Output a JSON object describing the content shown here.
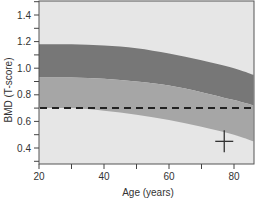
{
  "chart_data": {
    "type": "area",
    "title": "",
    "xlabel": "Age (years)",
    "ylabel": "BMD (T-score)",
    "xlim": [
      20,
      86
    ],
    "ylim": [
      0.3,
      1.5
    ],
    "xticks": [
      20,
      40,
      60,
      80
    ],
    "xtick_labels": [
      "20",
      "40",
      "60",
      "80"
    ],
    "yticks": [
      0.4,
      0.6,
      0.8,
      1.0,
      1.2,
      1.4
    ],
    "ytick_labels": [
      "0.4",
      "0.6",
      "0.8",
      "1.0",
      "1.2",
      "1.4"
    ],
    "grid": false,
    "legend": null,
    "x": [
      20,
      30,
      40,
      50,
      60,
      70,
      80,
      86
    ],
    "series": [
      {
        "name": "upper band (dark)",
        "color": "#777777",
        "upper": [
          1.18,
          1.18,
          1.17,
          1.15,
          1.11,
          1.06,
          1.0,
          0.95
        ],
        "lower": [
          0.93,
          0.93,
          0.92,
          0.9,
          0.87,
          0.82,
          0.76,
          0.72
        ]
      },
      {
        "name": "lower band (medium)",
        "color": "#a6a6a6",
        "upper": [
          0.93,
          0.93,
          0.92,
          0.9,
          0.87,
          0.82,
          0.76,
          0.72
        ],
        "lower": [
          0.7,
          0.7,
          0.68,
          0.65,
          0.61,
          0.56,
          0.5,
          0.45
        ]
      }
    ],
    "reference_line": {
      "y": 0.7,
      "style": "dashed",
      "color": "#222222"
    },
    "marker": {
      "x": 77,
      "y": 0.45,
      "shape": "crosshair",
      "color": "#333333"
    },
    "background_color": "#e6e6e6"
  }
}
